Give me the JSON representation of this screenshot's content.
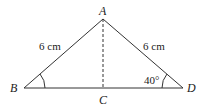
{
  "diagram": {
    "type": "triangle",
    "vertices": {
      "A": {
        "label": "A",
        "x": 103,
        "y": 19
      },
      "B": {
        "label": "B",
        "x": 24,
        "y": 88
      },
      "C": {
        "label": "C",
        "x": 103,
        "y": 88
      },
      "D": {
        "label": "D",
        "x": 183,
        "y": 88
      }
    },
    "sides": {
      "AB": "6 cm",
      "AD": "6 cm"
    },
    "angles": {
      "D": "40°"
    },
    "colors": {
      "stroke": "#333333",
      "background": "#ffffff"
    }
  }
}
